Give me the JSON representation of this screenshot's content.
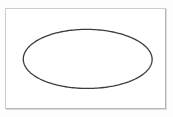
{
  "figure": {
    "title": "",
    "caption": "",
    "background_color": "#ffffff",
    "page_background_color": "#fdfdfd",
    "frame": {
      "name": "figure-border",
      "border_color": "#cdcdcd",
      "shadow_color": "#dcdcdc",
      "left": 5,
      "top": 8,
      "width": 161,
      "height": 101
    }
  },
  "chart_data": {
    "type": "diagram",
    "title": "",
    "subtitle": "",
    "xlabel": "",
    "ylabel": "",
    "grid": false,
    "legend": "none",
    "annotations": [],
    "shapes": [
      {
        "name": "ellipse-outline",
        "shape": "ellipse",
        "cx": 87.5,
        "cy": 59,
        "rx": 64.5,
        "ry": 29.5,
        "stroke": "#3d3d3d",
        "stroke_width": 1.3,
        "fill": "none",
        "style": "hand-drawn"
      }
    ]
  }
}
